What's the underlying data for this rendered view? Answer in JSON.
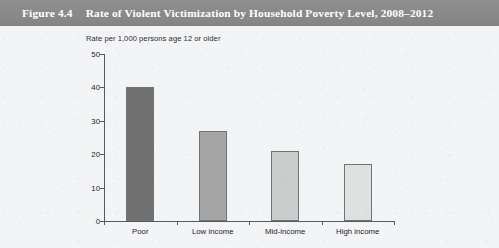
{
  "header": {
    "figure_number": "Figure 4.4",
    "title": "Rate of Violent Victimization by Household Poverty Level, 2008–2012",
    "band_color": "#8b8b8b",
    "text_color": "#ffffff"
  },
  "chart_data": {
    "type": "bar",
    "title": "Rate of Violent Victimization by Household Poverty Level, 2008–2012",
    "subtitle": "",
    "ylabel": "Rate per 1,000 persons age 12 or older",
    "xlabel": "",
    "categories": [
      "Poor",
      "Low income",
      "Mid-income",
      "High income"
    ],
    "values": [
      40,
      27,
      21,
      17
    ],
    "ylim": [
      0,
      50
    ],
    "yticks": [
      0,
      10,
      20,
      30,
      40,
      50
    ],
    "ytick_labels": [
      "0",
      "10",
      "20",
      "30",
      "40",
      "50"
    ],
    "grid": false,
    "legend": false,
    "legend_position": "none",
    "bar_colors": [
      "#707070",
      "#a6a6a6",
      "#cbcdcd",
      "#dfe1e1"
    ],
    "bar_edge_color": "#6d7478",
    "axis_color": "#555b60",
    "background_color": "#f2f4f6"
  }
}
